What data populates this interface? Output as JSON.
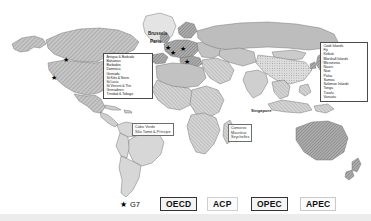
{
  "map": {
    "title": "World map of international organisation membership",
    "colors": {
      "land_base": "#b9b9b9",
      "land_light": "#dcdcdc",
      "land_dark": "#8f8f8f",
      "ocean": "#ffffff",
      "outline": "#6b6b6b",
      "text": "#2b2b2b"
    }
  },
  "callouts": {
    "caribbean": {
      "name": "Caribbean ACP states",
      "items": [
        "Antigua & Barbuda",
        "Bahamas",
        "Barbados",
        "Dominica",
        "Grenada",
        "St Kitts & Nevis",
        "St Lucia",
        "St Vincent & The",
        "Grenadines",
        "Trinidad & Tobago"
      ]
    },
    "pacific": {
      "name": "Pacific ACP states",
      "items": [
        "Cook Islands",
        "Fiji",
        "Kiribati",
        "Marshall Islands",
        "Micronesia",
        "Nauru",
        "Niue",
        "Palau",
        "Samoa",
        "Solomon Islands",
        "Tonga",
        "Tuvalu",
        "Vanuatu"
      ]
    },
    "atlantic_islands": {
      "name": "Atlantic island states",
      "items": [
        "Cabo Verde",
        "São Tomé & Príncipe"
      ]
    },
    "indian_islands": {
      "name": "Indian Ocean island states",
      "items": [
        "Comoros",
        "Mauritius",
        "Seychelles"
      ]
    }
  },
  "city_labels": {
    "brussels": "Brussels",
    "paris": "Paris",
    "singapore": "Singapore"
  },
  "legend": {
    "g7": {
      "marker": "star-icon",
      "symbol": "★",
      "label": "G7"
    },
    "items": [
      {
        "label": "OECD"
      },
      {
        "label": "ACP"
      },
      {
        "label": "OPEC"
      },
      {
        "label": "APEC"
      }
    ]
  }
}
